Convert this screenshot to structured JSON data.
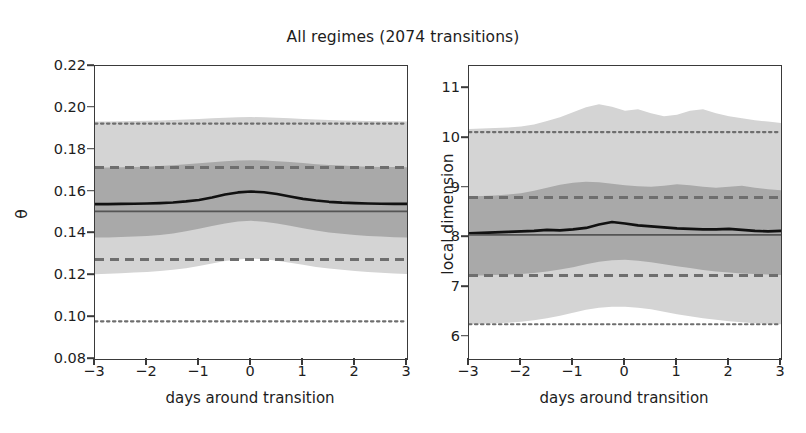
{
  "figure": {
    "title": "All regimes (2074 transitions)",
    "n_transitions": 2074
  },
  "panels": {
    "a": {
      "tag": "(a)",
      "ylabel": "θ",
      "xlabel": "days around transition",
      "yticks": [
        "0.08",
        "0.10",
        "0.12",
        "0.14",
        "0.16",
        "0.18",
        "0.20",
        "0.22"
      ],
      "xticks": [
        "−3",
        "−2",
        "−1",
        "0",
        "1",
        "2",
        "3"
      ]
    },
    "b": {
      "tag": "(b)",
      "ylabel": "local dimension",
      "xlabel": "days around transition",
      "yticks": [
        "6",
        "7",
        "8",
        "9",
        "10",
        "11"
      ],
      "xticks": [
        "−3",
        "−2",
        "−1",
        "0",
        "1",
        "2",
        "3"
      ]
    }
  },
  "colors": {
    "mean_line": "#111111",
    "climatology_line": "#555555",
    "dashed_reference": "#6e6e6e",
    "dotted_reference": "#6e6e6e",
    "band_inner": "#a9a9a9",
    "band_outer": "#d4d4d4",
    "axis": "#3a3a3a",
    "background": "#ffffff"
  },
  "chart_data": [
    {
      "type": "line",
      "panel": "a",
      "title": "All regimes (2074 transitions)",
      "xlabel": "days around transition",
      "ylabel": "θ",
      "xlim": [
        -3,
        3
      ],
      "ylim": [
        0.08,
        0.22
      ],
      "grid": false,
      "legend": null,
      "x": [
        -3.0,
        -2.75,
        -2.5,
        -2.25,
        -2.0,
        -1.75,
        -1.5,
        -1.25,
        -1.0,
        -0.75,
        -0.5,
        -0.25,
        0.0,
        0.25,
        0.5,
        0.75,
        1.0,
        1.25,
        1.5,
        1.75,
        2.0,
        2.25,
        2.5,
        2.75,
        3.0
      ],
      "series": [
        {
          "name": "composite mean θ",
          "style": "solid-black",
          "values": [
            0.154,
            0.154,
            0.1541,
            0.1542,
            0.1543,
            0.1545,
            0.1548,
            0.1553,
            0.156,
            0.1572,
            0.1586,
            0.1596,
            0.16,
            0.1597,
            0.1588,
            0.1576,
            0.1565,
            0.1557,
            0.1551,
            0.1547,
            0.1545,
            0.1543,
            0.1542,
            0.1541,
            0.1541
          ]
        },
        {
          "name": "climatological mean θ",
          "style": "solid-gray",
          "values": [
            0.1505,
            0.1505,
            0.1505,
            0.1505,
            0.1505,
            0.1505,
            0.1505,
            0.1505,
            0.1505,
            0.1505,
            0.1505,
            0.1505,
            0.1505,
            0.1505,
            0.1505,
            0.1505,
            0.1505,
            0.1505,
            0.1505,
            0.1505,
            0.1505,
            0.1505,
            0.1505,
            0.1505,
            0.1505
          ]
        }
      ],
      "bands": [
        {
          "name": "outer percentile band (5th–95th)",
          "fill": "#d4d4d4",
          "upper": [
            0.1935,
            0.1935,
            0.1936,
            0.1937,
            0.1938,
            0.194,
            0.1942,
            0.1944,
            0.1947,
            0.195,
            0.1953,
            0.1955,
            0.1956,
            0.1955,
            0.1953,
            0.195,
            0.1947,
            0.1944,
            0.1942,
            0.194,
            0.1938,
            0.1937,
            0.1936,
            0.1936,
            0.1935
          ],
          "lower": [
            0.1205,
            0.1207,
            0.121,
            0.1213,
            0.1216,
            0.122,
            0.1226,
            0.1234,
            0.1244,
            0.1256,
            0.1268,
            0.1276,
            0.128,
            0.1277,
            0.127,
            0.126,
            0.125,
            0.124,
            0.1232,
            0.1226,
            0.122,
            0.1216,
            0.1212,
            0.1209,
            0.1206
          ]
        },
        {
          "name": "inner percentile band (25th–75th)",
          "fill": "#a9a9a9",
          "upper": [
            0.1715,
            0.1715,
            0.1716,
            0.1717,
            0.1719,
            0.1722,
            0.1726,
            0.173,
            0.1735,
            0.174,
            0.1745,
            0.1748,
            0.175,
            0.1748,
            0.1745,
            0.1741,
            0.1736,
            0.1731,
            0.1727,
            0.1724,
            0.1721,
            0.1719,
            0.1718,
            0.1717,
            0.1716
          ],
          "lower": [
            0.138,
            0.1381,
            0.1383,
            0.1385,
            0.1388,
            0.1393,
            0.14,
            0.141,
            0.1422,
            0.1435,
            0.1448,
            0.1457,
            0.146,
            0.1456,
            0.1448,
            0.1437,
            0.1425,
            0.1414,
            0.1405,
            0.1398,
            0.1392,
            0.1388,
            0.1385,
            0.1382,
            0.138
          ]
        }
      ],
      "reference_lines": [
        {
          "name": "upper dotted reference",
          "style": "dotted",
          "value": 0.1925
        },
        {
          "name": "upper dashed reference",
          "style": "dashed",
          "value": 0.1715
        },
        {
          "name": "lower dashed reference",
          "style": "dashed",
          "value": 0.1275
        },
        {
          "name": "lower dotted reference",
          "style": "dotted",
          "value": 0.098
        }
      ]
    },
    {
      "type": "line",
      "panel": "b",
      "title": "All regimes (2074 transitions)",
      "xlabel": "days around transition",
      "ylabel": "local dimension",
      "xlim": [
        -3,
        3
      ],
      "ylim": [
        5.55,
        11.45
      ],
      "grid": false,
      "legend": null,
      "x": [
        -3.0,
        -2.75,
        -2.5,
        -2.25,
        -2.0,
        -1.75,
        -1.5,
        -1.25,
        -1.0,
        -0.75,
        -0.5,
        -0.25,
        0.0,
        0.25,
        0.5,
        0.75,
        1.0,
        1.25,
        1.5,
        1.75,
        2.0,
        2.25,
        2.5,
        2.75,
        3.0
      ],
      "series": [
        {
          "name": "composite mean local dimension",
          "style": "solid-black",
          "values": [
            8.08,
            8.09,
            8.1,
            8.11,
            8.12,
            8.13,
            8.15,
            8.14,
            8.16,
            8.19,
            8.26,
            8.31,
            8.28,
            8.24,
            8.22,
            8.2,
            8.18,
            8.17,
            8.16,
            8.16,
            8.17,
            8.15,
            8.13,
            8.12,
            8.13
          ]
        },
        {
          "name": "climatological mean local dimension",
          "style": "solid-gray",
          "values": [
            8.05,
            8.05,
            8.05,
            8.05,
            8.05,
            8.05,
            8.05,
            8.05,
            8.05,
            8.05,
            8.05,
            8.05,
            8.05,
            8.05,
            8.05,
            8.05,
            8.05,
            8.05,
            8.05,
            8.05,
            8.05,
            8.05,
            8.05,
            8.05,
            8.05
          ]
        }
      ],
      "bands": [
        {
          "name": "outer percentile band (5th–95th)",
          "fill": "#d4d4d4",
          "upper": [
            10.18,
            10.19,
            10.2,
            10.21,
            10.23,
            10.27,
            10.34,
            10.42,
            10.52,
            10.62,
            10.68,
            10.63,
            10.55,
            10.58,
            10.5,
            10.44,
            10.47,
            10.55,
            10.58,
            10.5,
            10.44,
            10.4,
            10.36,
            10.33,
            10.3
          ],
          "lower": [
            6.25,
            6.26,
            6.27,
            6.28,
            6.3,
            6.33,
            6.37,
            6.42,
            6.48,
            6.54,
            6.58,
            6.6,
            6.6,
            6.58,
            6.55,
            6.5,
            6.45,
            6.41,
            6.37,
            6.34,
            6.31,
            6.29,
            6.27,
            6.26,
            6.25
          ]
        },
        {
          "name": "inner percentile band (25th–75th)",
          "fill": "#a9a9a9",
          "upper": [
            8.82,
            8.83,
            8.84,
            8.86,
            8.89,
            8.94,
            9.0,
            9.06,
            9.1,
            9.12,
            9.11,
            9.08,
            9.05,
            9.03,
            9.02,
            9.04,
            9.07,
            9.05,
            9.02,
            9.0,
            9.02,
            9.04,
            9.0,
            8.97,
            8.95
          ],
          "lower": [
            7.23,
            7.23,
            7.24,
            7.25,
            7.26,
            7.28,
            7.31,
            7.35,
            7.4,
            7.46,
            7.51,
            7.54,
            7.55,
            7.53,
            7.5,
            7.46,
            7.42,
            7.38,
            7.34,
            7.31,
            7.29,
            7.27,
            7.26,
            7.25,
            7.24
          ]
        }
      ],
      "reference_lines": [
        {
          "name": "upper dotted reference",
          "style": "dotted",
          "value": 10.12
        },
        {
          "name": "upper dashed reference",
          "style": "dashed",
          "value": 8.8
        },
        {
          "name": "lower dashed reference",
          "style": "dashed",
          "value": 7.23
        },
        {
          "name": "lower dotted reference",
          "style": "dotted",
          "value": 6.25
        }
      ]
    }
  ]
}
